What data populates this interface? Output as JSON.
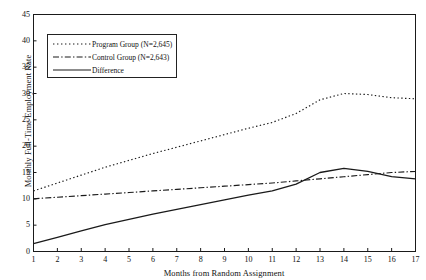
{
  "chart_data": {
    "type": "line",
    "title": "",
    "xlabel": "Months from Random Assignment",
    "ylabel": "Monthly Full-Time Employment Rate",
    "xlim": [
      1,
      17
    ],
    "ylim": [
      0,
      45
    ],
    "ytick_labels": [
      "0",
      "5",
      "10",
      "15",
      "20",
      "25",
      "30",
      "35",
      "40",
      "45"
    ],
    "ytick_values": [
      0,
      5,
      10,
      15,
      20,
      25,
      30,
      35,
      40,
      45
    ],
    "xtick_labels": [
      "1",
      "2",
      "3",
      "4",
      "5",
      "6",
      "7",
      "8",
      "9",
      "10",
      "11",
      "12",
      "13",
      "14",
      "15",
      "16",
      "17"
    ],
    "x": [
      1,
      2,
      3,
      4,
      5,
      6,
      7,
      8,
      9,
      10,
      11,
      12,
      13,
      14,
      15,
      16,
      17
    ],
    "grid": false,
    "legend_position": "upper-left",
    "series": [
      {
        "name": "Program Group (N=2,645)",
        "key_style": "dotted",
        "values": [
          11.5,
          13.0,
          14.5,
          16.0,
          17.3,
          18.6,
          19.8,
          21.0,
          22.2,
          23.4,
          24.5,
          26.2,
          28.8,
          30.0,
          29.8,
          29.2,
          29.0
        ]
      },
      {
        "name": "Control Group (N=2,643)",
        "key_style": "dash-dot",
        "values": [
          10.0,
          10.3,
          10.6,
          10.9,
          11.2,
          11.5,
          11.8,
          12.1,
          12.4,
          12.7,
          13.0,
          13.4,
          13.8,
          14.2,
          14.6,
          15.0,
          15.2
        ]
      },
      {
        "name": "Difference",
        "key_style": "solid",
        "values": [
          1.5,
          2.7,
          3.9,
          5.1,
          6.1,
          7.1,
          8.0,
          8.9,
          9.8,
          10.7,
          11.5,
          12.8,
          15.0,
          15.8,
          15.2,
          14.2,
          13.8
        ]
      }
    ]
  },
  "legend": {
    "items": [
      {
        "label": "Program Group (N=2,645)"
      },
      {
        "label": "Control Group (N=2,643)"
      },
      {
        "label": "Difference"
      }
    ]
  },
  "colors": {
    "line": "#1a1a1a",
    "axis": "#1a1a1a",
    "background": "#ffffff"
  }
}
